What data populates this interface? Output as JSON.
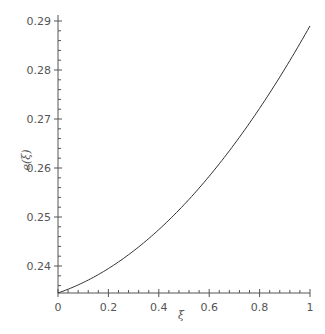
{
  "chart_data": {
    "type": "line",
    "title": "",
    "xlabel": "ξ",
    "ylabel": "e(ξ)",
    "xlim": [
      0,
      1
    ],
    "ylim": [
      0.2335,
      0.2915
    ],
    "grid": false,
    "legend": null,
    "x_ticks": [
      "0",
      "0.2",
      "0.4",
      "0.6",
      "0.8",
      "1"
    ],
    "y_ticks": [
      "0.24",
      "0.25",
      "0.26",
      "0.27",
      "0.28",
      "0.29"
    ],
    "series": [
      {
        "name": "e(ξ)",
        "color": "#333333",
        "x": [
          0,
          0.1,
          0.2,
          0.3,
          0.4,
          0.5,
          0.6,
          0.7,
          0.8,
          0.9,
          1.0
        ],
        "y": [
          0.2345,
          0.2368,
          0.2396,
          0.243,
          0.247,
          0.2515,
          0.2567,
          0.2625,
          0.2688,
          0.2756,
          0.289
        ]
      }
    ]
  }
}
